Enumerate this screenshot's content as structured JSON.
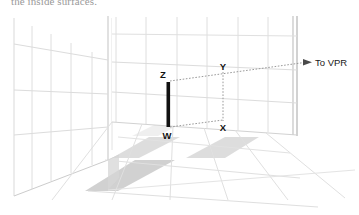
{
  "figure": {
    "caption_above": "the inside surfaces.",
    "scene_type": "one-point-perspective room interior with grid walls and checkerboard floor",
    "labels": {
      "z": "Z",
      "y": "Y",
      "w": "W",
      "x": "X",
      "vanishing_point_ray": "To VPR"
    },
    "colors": {
      "background": "#ffffff",
      "grid_line": "#dcdcdc",
      "grid_line_light": "#e8e8e8",
      "wall_edge": "#b8b8b8",
      "dashed_line": "#9a9a9a",
      "pole": "#111111",
      "tile_gray": "#cfcfcf",
      "tile_gray_dark": "#c2c2c2",
      "label_text": "#111111",
      "caption_text": "#9a9a9a"
    },
    "elements": {
      "pole_label": "vertical-post-ZW",
      "pole_top": "Z",
      "pole_bottom": "W",
      "projection_top": "Y",
      "projection_bottom": "X",
      "arrow_direction": "right"
    }
  }
}
